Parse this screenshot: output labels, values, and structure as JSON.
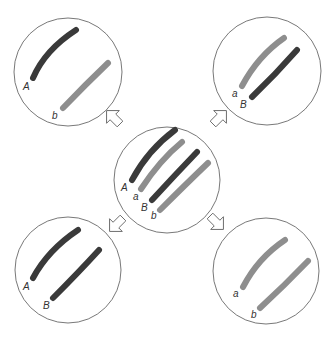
{
  "diagram": {
    "colors": {
      "dark": "#3a3a3a",
      "light": "#8e8e8e",
      "outline": "#555555",
      "arrow": "#666666"
    },
    "center": {
      "labels": [
        "A",
        "a",
        "B",
        "b"
      ]
    },
    "cells": {
      "top_left": {
        "labels": [
          "A",
          "b"
        ]
      },
      "top_right": {
        "labels": [
          "a",
          "B"
        ]
      },
      "bottom_left": {
        "labels": [
          "A",
          "B"
        ]
      },
      "bottom_right": {
        "labels": [
          "a",
          "b"
        ]
      }
    }
  }
}
